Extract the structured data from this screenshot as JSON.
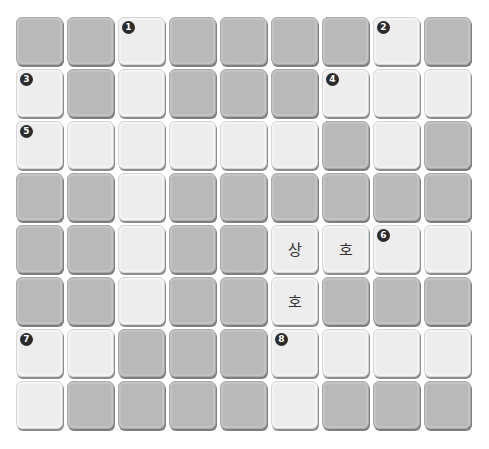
{
  "puzzle": {
    "rows": 8,
    "cols": 9,
    "colors": {
      "dark_cell": "#b9b9b9",
      "light_cell": "#ededed",
      "badge": "#2b2b2b"
    },
    "grid": [
      [
        {
          "t": "D"
        },
        {
          "t": "D"
        },
        {
          "t": "L",
          "n": "1"
        },
        {
          "t": "D"
        },
        {
          "t": "D"
        },
        {
          "t": "D"
        },
        {
          "t": "D"
        },
        {
          "t": "L",
          "n": "2"
        },
        {
          "t": "D"
        }
      ],
      [
        {
          "t": "L",
          "n": "3"
        },
        {
          "t": "D"
        },
        {
          "t": "L"
        },
        {
          "t": "D"
        },
        {
          "t": "D"
        },
        {
          "t": "D"
        },
        {
          "t": "L",
          "n": "4"
        },
        {
          "t": "L"
        },
        {
          "t": "L"
        }
      ],
      [
        {
          "t": "L",
          "n": "5"
        },
        {
          "t": "L"
        },
        {
          "t": "L"
        },
        {
          "t": "L"
        },
        {
          "t": "L"
        },
        {
          "t": "L"
        },
        {
          "t": "D"
        },
        {
          "t": "L"
        },
        {
          "t": "D"
        }
      ],
      [
        {
          "t": "D"
        },
        {
          "t": "D"
        },
        {
          "t": "L"
        },
        {
          "t": "D"
        },
        {
          "t": "D"
        },
        {
          "t": "D"
        },
        {
          "t": "D"
        },
        {
          "t": "D"
        },
        {
          "t": "D"
        }
      ],
      [
        {
          "t": "D"
        },
        {
          "t": "D"
        },
        {
          "t": "L"
        },
        {
          "t": "D"
        },
        {
          "t": "D"
        },
        {
          "t": "L",
          "c": "상"
        },
        {
          "t": "L",
          "c": "호"
        },
        {
          "t": "L",
          "n": "6"
        },
        {
          "t": "L"
        }
      ],
      [
        {
          "t": "D"
        },
        {
          "t": "D"
        },
        {
          "t": "L"
        },
        {
          "t": "D"
        },
        {
          "t": "D"
        },
        {
          "t": "L",
          "c": "호"
        },
        {
          "t": "D"
        },
        {
          "t": "D"
        },
        {
          "t": "D"
        }
      ],
      [
        {
          "t": "L",
          "n": "7"
        },
        {
          "t": "L"
        },
        {
          "t": "D"
        },
        {
          "t": "D"
        },
        {
          "t": "D"
        },
        {
          "t": "L",
          "n": "8"
        },
        {
          "t": "L"
        },
        {
          "t": "L"
        },
        {
          "t": "L"
        }
      ],
      [
        {
          "t": "L"
        },
        {
          "t": "D"
        },
        {
          "t": "D"
        },
        {
          "t": "D"
        },
        {
          "t": "D"
        },
        {
          "t": "L"
        },
        {
          "t": "D"
        },
        {
          "t": "D"
        },
        {
          "t": "D"
        }
      ]
    ]
  }
}
